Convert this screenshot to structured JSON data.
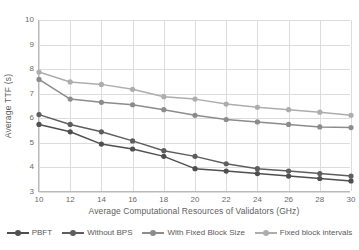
{
  "chart_data": {
    "type": "line",
    "title": "",
    "xlabel": "Average Computational Resources of Validators (GHz)",
    "ylabel": "Average TTF (s)",
    "x": [
      10,
      12,
      14,
      16,
      18,
      20,
      22,
      24,
      26,
      28,
      30
    ],
    "xlim": [
      10,
      30
    ],
    "ylim": [
      3,
      10
    ],
    "xticks": [
      "10",
      "12",
      "14",
      "16",
      "18",
      "20",
      "22",
      "24",
      "26",
      "28",
      "30"
    ],
    "yticks": [
      "3",
      "4",
      "5",
      "6",
      "7",
      "8",
      "9",
      "10"
    ],
    "grid": true,
    "legend_position": "bottom",
    "series": [
      {
        "name": "PBFT",
        "color": "#4f4f4f",
        "values": [
          5.75,
          5.45,
          4.95,
          4.75,
          4.45,
          3.95,
          3.85,
          3.75,
          3.65,
          3.55,
          3.45
        ]
      },
      {
        "name": "Without BPS",
        "color": "#5e5e5e",
        "values": [
          6.15,
          5.75,
          5.45,
          5.08,
          4.68,
          4.45,
          4.15,
          3.95,
          3.85,
          3.75,
          3.65
        ]
      },
      {
        "name": "With Fixed Block Size",
        "color": "#8c8c8c",
        "values": [
          7.58,
          6.78,
          6.65,
          6.55,
          6.35,
          6.12,
          5.95,
          5.85,
          5.75,
          5.65,
          5.62
        ]
      },
      {
        "name": "Fixed block intervals",
        "color": "#adadad",
        "values": [
          7.88,
          7.48,
          7.38,
          7.18,
          6.88,
          6.78,
          6.58,
          6.45,
          6.35,
          6.25,
          6.12
        ]
      }
    ]
  }
}
